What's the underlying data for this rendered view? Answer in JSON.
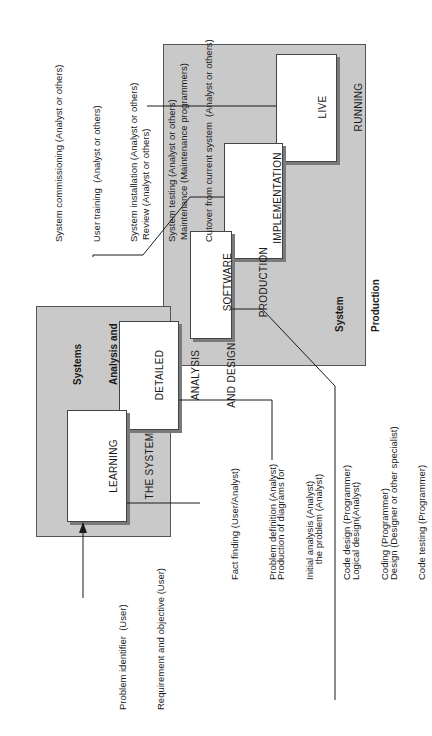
{
  "diagram": {
    "orientation": "rotated-90-ccw",
    "panels": {
      "system_production": {
        "label_line1": "System",
        "label_line2": "Production"
      },
      "systems_analysis": {
        "label_line1": "Systems",
        "label_line2": "Analysis and",
        "label_line3": "Design"
      }
    },
    "stages": [
      {
        "line1": "LEARNING",
        "line2": "THE SYSTEM"
      },
      {
        "line1": "DETAILED",
        "line2": "ANALYSIS",
        "line3": "AND DESIGN"
      },
      {
        "line1": "SOFTWARE",
        "line2": "PRODUCTION"
      },
      {
        "line1": "IMPLEMENTATION"
      },
      {
        "line1": "LIVE",
        "line2": "RUNNING"
      }
    ],
    "notes": {
      "input": [
        "Problem identifier  (User)",
        "Requirement and objective (User)"
      ],
      "learning": [
        "Fact finding (User/Analyst)",
        "Problem definition (Analyst)",
        "Initial analysis (Analyst)"
      ],
      "detailed": [
        "Production of diagrams for",
        "      the problem (Analyst)",
        "Logical design(Analyst)",
        "Design (Designer or other specialist)"
      ],
      "software": [
        "Code design (Programmer)",
        "Coding (Programmer)",
        "Code testing (Programmer)"
      ],
      "implementation": [
        "System commissioning (Analyst or others)",
        "User training  (Analyst or others)",
        "System installation (Analyst or others)",
        "System testing (Analyst or others)",
        "Cutover from current system  (Analyst or others)"
      ],
      "live": [
        "Review (Analyst or others)",
        "Maintenance (Maintenance programmers)"
      ]
    },
    "colors": {
      "panel": "#c9c9c9",
      "box": "#ffffff",
      "line": "#1a1a1a",
      "shadow": "#7a7a7a"
    }
  }
}
